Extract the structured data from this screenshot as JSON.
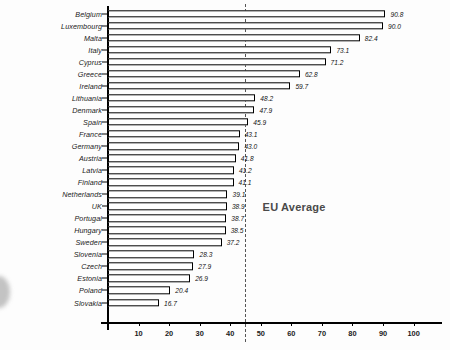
{
  "chart_data": {
    "type": "bar",
    "orientation": "horizontal",
    "title": "",
    "xlabel": "",
    "ylabel": "",
    "xlim": [
      0,
      105
    ],
    "grid": false,
    "legend": false,
    "categories": [
      "Belgium",
      "Luxembourg",
      "Malta",
      "Italy",
      "Cyprus",
      "Greece",
      "Ireland",
      "Lithuania",
      "Denmark",
      "Spain",
      "France",
      "Germany",
      "Austria",
      "Latvia",
      "Finland",
      "Netherlands",
      "UK",
      "Portugal",
      "Hungary",
      "Sweden",
      "Slovenia",
      "Czech",
      "Estonia",
      "Poland",
      "Slovakia"
    ],
    "values": [
      90.8,
      90.0,
      82.4,
      73.1,
      71.2,
      62.8,
      59.7,
      48.2,
      47.9,
      45.9,
      43.1,
      43.0,
      41.8,
      41.2,
      41.1,
      39.1,
      38.9,
      38.7,
      38.5,
      37.2,
      28.3,
      27.9,
      26.9,
      20.4,
      16.7
    ],
    "value_labels": [
      "90.8",
      "90.0",
      "82.4",
      "73.1",
      "71.2",
      "62.8",
      "59.7",
      "48.2",
      "47.9",
      "45.9",
      "43.1",
      "43.0",
      "41.8",
      "41.2",
      "41.1",
      "39.1",
      "38.9",
      "38.7",
      "38.5",
      "37.2",
      "28.3",
      "27.9",
      "26.9",
      "20.4",
      "16.7"
    ],
    "xticks": [
      10,
      20,
      30,
      40,
      50,
      60,
      70,
      80,
      90,
      100
    ],
    "xtick_labels": [
      "10",
      "20",
      "30",
      "40",
      "50",
      "60",
      "70",
      "80",
      "90",
      "100"
    ],
    "annotations": [
      {
        "name": "eu-average",
        "label": "EU Average",
        "value": 44.7,
        "style": "dashed-vertical-line"
      }
    ],
    "colors": {
      "bar_fill": "#ffffff",
      "bar_edge": "#000000",
      "axis": "#000000",
      "annotation_text": "#4a4a4a",
      "annotation_line": "#555555",
      "background": "#fdfdfd",
      "label_text": "#1a1a1a"
    }
  }
}
